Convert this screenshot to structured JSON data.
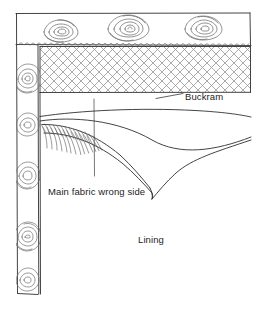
{
  "figure": {
    "type": "technical line illustration",
    "background_color": "#ffffff",
    "ink_color": "#2a2a2a",
    "hatch_color": "#9a9a9a"
  },
  "labels": {
    "buckram": "Buckram",
    "main_fabric": "Main fabric wrong side",
    "lining": "Lining"
  },
  "parts": [
    {
      "name": "buckram-band",
      "label": "Buckram",
      "pattern": "diagonal cross-hatch lattice"
    },
    {
      "name": "main-fabric",
      "label": "Main fabric wrong side",
      "pattern": "folded drape with gathers"
    },
    {
      "name": "lining",
      "label": "Lining",
      "pattern": "plain"
    },
    {
      "name": "floral-border",
      "label": "",
      "pattern": "rose motifs"
    },
    {
      "name": "stitch-line",
      "label": "",
      "pattern": "zigzag stitching"
    }
  ]
}
